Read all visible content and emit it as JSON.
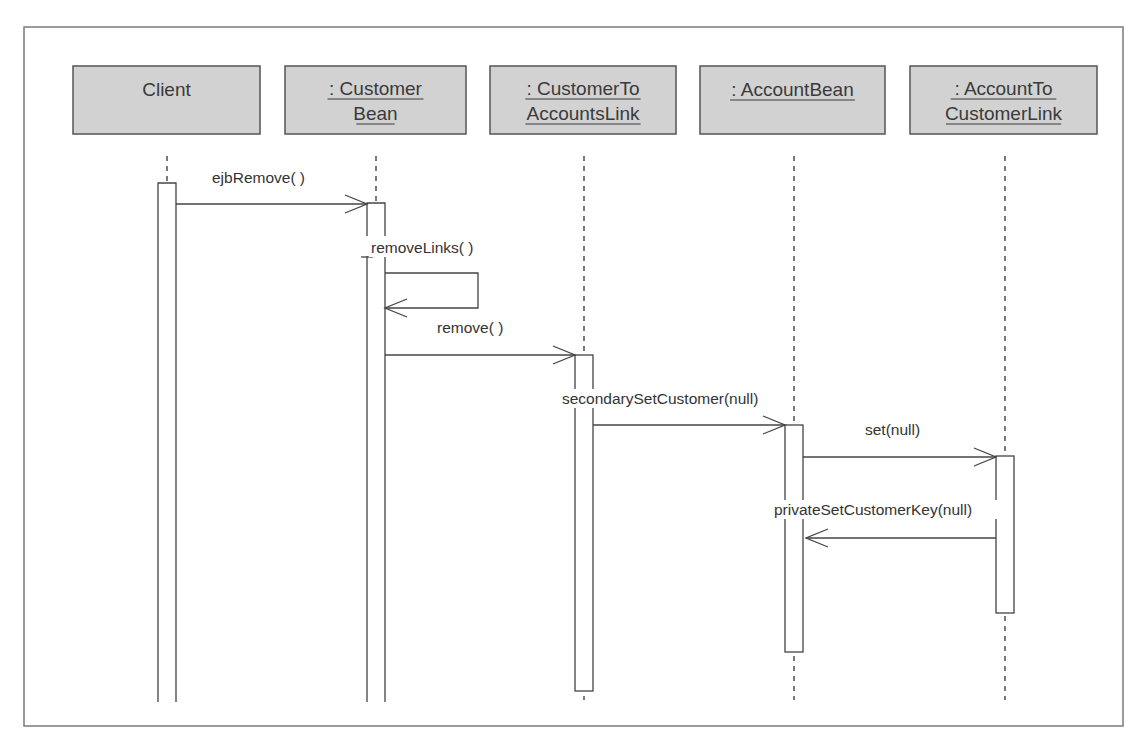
{
  "diagram": {
    "type": "UML sequence diagram",
    "frame": {
      "x": 24,
      "y": 27,
      "width": 1099,
      "height": 699
    },
    "colors": {
      "object_fill": "#d2d2d2",
      "object_stroke": "#555555",
      "line": "#444444",
      "text": "#333333",
      "frame_stroke": "#7a7a7a"
    },
    "objects": [
      {
        "id": "client",
        "line1": "Client",
        "line2": "",
        "underlined": false,
        "box": {
          "x": 73,
          "y": 66,
          "w": 187,
          "h": 68
        },
        "lifeline_x": 167
      },
      {
        "id": "customer-bean",
        "line1": ": Customer",
        "line2": "Bean",
        "underlined": true,
        "box": {
          "x": 285,
          "y": 66,
          "w": 181,
          "h": 68
        },
        "lifeline_x": 376
      },
      {
        "id": "customer-to-accounts-link",
        "line1": ": CustomerTo",
        "line2": "AccountsLink",
        "underlined": true,
        "box": {
          "x": 490,
          "y": 66,
          "w": 186,
          "h": 68
        },
        "lifeline_x": 584
      },
      {
        "id": "account-bean",
        "line1": ": AccountBean",
        "line2": "",
        "underlined": true,
        "box": {
          "x": 700,
          "y": 66,
          "w": 185,
          "h": 68
        },
        "lifeline_x": 794
      },
      {
        "id": "account-to-customer-link",
        "line1": ": AccountTo",
        "line2": "CustomerLink",
        "underlined": true,
        "box": {
          "x": 910,
          "y": 66,
          "w": 187,
          "h": 68
        },
        "lifeline_x": 1005
      }
    ],
    "lifeline_top": 156,
    "lifeline_bottom": 700,
    "activations": [
      {
        "object": "client",
        "x": 158,
        "top": 183,
        "bottom": 702,
        "open_bottom": true
      },
      {
        "object": "customer-bean",
        "x": 367,
        "top": 203,
        "bottom": 702,
        "open_bottom": true
      },
      {
        "object": "customer-to-accounts-link",
        "x": 575,
        "top": 355,
        "bottom": 691,
        "open_bottom": false
      },
      {
        "object": "account-bean",
        "x": 785,
        "top": 425,
        "bottom": 652,
        "open_bottom": false
      },
      {
        "object": "account-to-customer-link",
        "x": 996,
        "top": 456,
        "bottom": 613,
        "open_bottom": false
      }
    ],
    "activation_width": 18,
    "messages": [
      {
        "id": "ejb-remove",
        "label": "ejbRemove( )",
        "from": "client",
        "to": "customer-bean",
        "x1": 176,
        "x2": 367,
        "y": 204,
        "label_x": 212,
        "label_y": 183,
        "kind": "call"
      },
      {
        "id": "remove-links",
        "label": "removeLinks( )",
        "from": "customer-bean",
        "to": "customer-bean",
        "x1": 385,
        "x2": 385,
        "y": 273,
        "y2": 308,
        "loop_x": 478,
        "label_x": 371,
        "label_y": 253,
        "kind": "self"
      },
      {
        "id": "remove",
        "label": "remove( )",
        "from": "customer-bean",
        "to": "customer-to-accounts-link",
        "x1": 385,
        "x2": 575,
        "y": 355,
        "label_x": 437,
        "label_y": 333,
        "kind": "call"
      },
      {
        "id": "secondary-set-customer",
        "label": "secondarySetCustomer(null)",
        "from": "customer-to-accounts-link",
        "to": "account-bean",
        "x1": 593,
        "x2": 785,
        "y": 425,
        "label_x": 562,
        "label_y": 404,
        "kind": "call"
      },
      {
        "id": "set",
        "label": "set(null)",
        "from": "account-bean",
        "to": "account-to-customer-link",
        "x1": 803,
        "x2": 996,
        "y": 457,
        "label_x": 865,
        "label_y": 435,
        "kind": "call"
      },
      {
        "id": "private-set-customer-key",
        "label": "privateSetCustomerKey(null)",
        "from": "account-to-customer-link",
        "to": "account-bean",
        "x1": 996,
        "x2": 806,
        "y": 538,
        "label_x": 774,
        "label_y": 515,
        "kind": "call"
      }
    ]
  }
}
